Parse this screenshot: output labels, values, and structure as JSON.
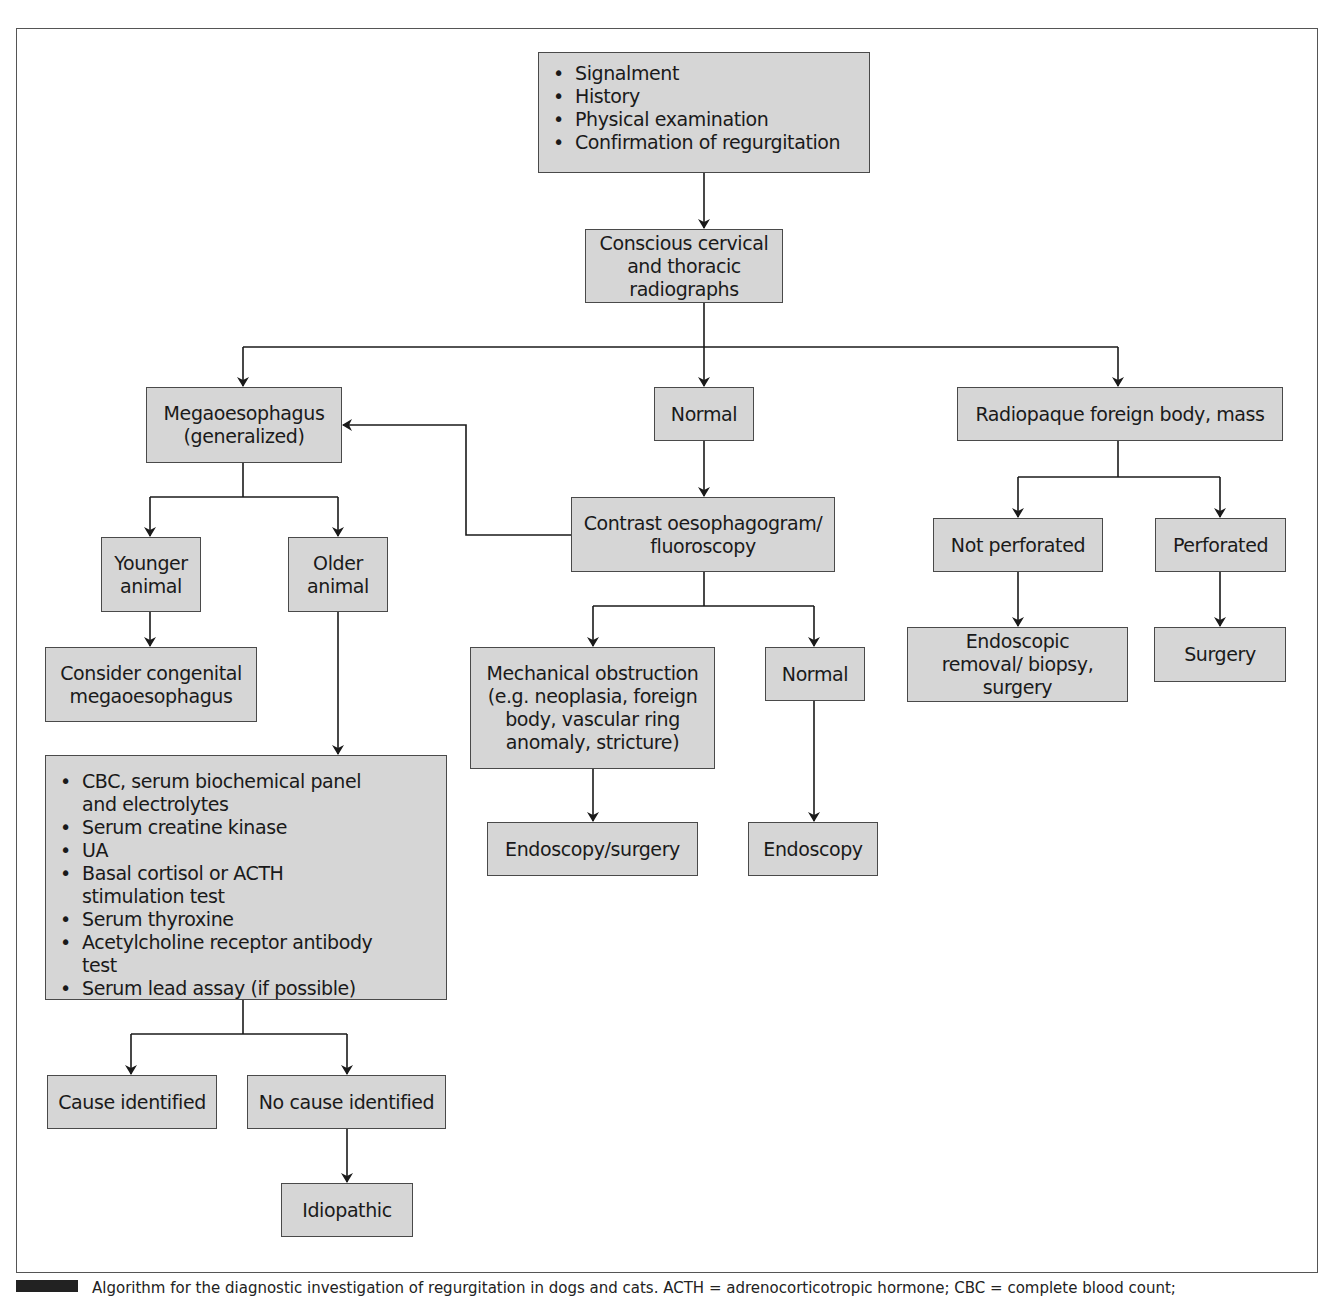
{
  "diagram": {
    "type": "flowchart",
    "title": "Algorithm for the diagnostic investigation of regurgitation",
    "colors": {
      "box_fill": "#d6d6d6",
      "box_border": "#4a4a4a",
      "line": "#1a1a1a",
      "frame": "#555555"
    },
    "nodes": {
      "start": {
        "items": [
          "Signalment",
          "History",
          "Physical examination",
          "Confirmation of regurgitation"
        ]
      },
      "radiographs": {
        "label": "Conscious cervical and thoracic radiographs"
      },
      "megaoesophagus": {
        "label": "Megaoesophagus (generalized)"
      },
      "normal_rad": {
        "label": "Normal"
      },
      "radiopaque": {
        "label": "Radiopaque foreign body, mass"
      },
      "younger": {
        "label": "Younger animal"
      },
      "older": {
        "label": "Older animal"
      },
      "congenital": {
        "label": "Consider congenital megaoesophagus"
      },
      "contrast": {
        "label": "Contrast oesophagogram/ fluoroscopy"
      },
      "mechanical": {
        "label": "Mechanical obstruction (e.g. neoplasia, foreign body, vascular ring anomaly, stricture)"
      },
      "normal_contrast": {
        "label": "Normal"
      },
      "endo_surgery": {
        "label": "Endoscopy/surgery"
      },
      "endoscopy": {
        "label": "Endoscopy"
      },
      "not_perforated": {
        "label": "Not perforated"
      },
      "perforated": {
        "label": "Perforated"
      },
      "endo_removal": {
        "label": "Endoscopic removal/ biopsy, surgery"
      },
      "surgery": {
        "label": "Surgery"
      },
      "tests": {
        "items": [
          "CBC, serum biochemical panel and electrolytes",
          "Serum creatine kinase",
          "UA",
          "Basal cortisol or ACTH stimulation test",
          "Serum thyroxine",
          "Acetylcholine receptor antibody test",
          "Serum lead assay (if possible)"
        ]
      },
      "cause": {
        "label": "Cause identified"
      },
      "no_cause": {
        "label": "No cause identified"
      },
      "idiopathic": {
        "label": "Idiopathic"
      }
    },
    "edges": [
      [
        "start",
        "radiographs"
      ],
      [
        "radiographs",
        "megaoesophagus"
      ],
      [
        "radiographs",
        "normal_rad"
      ],
      [
        "radiographs",
        "radiopaque"
      ],
      [
        "megaoesophagus",
        "younger"
      ],
      [
        "megaoesophagus",
        "older"
      ],
      [
        "younger",
        "congenital"
      ],
      [
        "older",
        "tests"
      ],
      [
        "tests",
        "cause"
      ],
      [
        "tests",
        "no_cause"
      ],
      [
        "no_cause",
        "idiopathic"
      ],
      [
        "normal_rad",
        "contrast"
      ],
      [
        "contrast",
        "megaoesophagus"
      ],
      [
        "contrast",
        "mechanical"
      ],
      [
        "contrast",
        "normal_contrast"
      ],
      [
        "mechanical",
        "endo_surgery"
      ],
      [
        "normal_contrast",
        "endoscopy"
      ],
      [
        "radiopaque",
        "not_perforated"
      ],
      [
        "radiopaque",
        "perforated"
      ],
      [
        "not_perforated",
        "endo_removal"
      ],
      [
        "perforated",
        "surgery"
      ]
    ]
  },
  "caption": {
    "text": "Algorithm for the diagnostic investigation of regurgitation in dogs and cats. ACTH = adrenocorticotropic hormone; CBC = complete blood count;"
  }
}
